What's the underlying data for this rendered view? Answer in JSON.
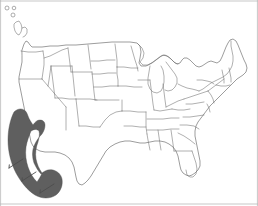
{
  "figure": {
    "width": 258,
    "height": 206,
    "background_color": "#ffffff",
    "frame_color": "#b9b9b9"
  },
  "map": {
    "projection_note": "contiguous United States with state boundaries",
    "outline_color": "#5a5a5a",
    "state_border_color": "#6e6e6e",
    "land_fill_color": "#ffffff"
  },
  "highlight_region": {
    "name": "west-coast-shaded-band",
    "label": "",
    "fill_color": "#5f5f5f",
    "shape": "crescent",
    "location": "Pacific coast / California"
  },
  "annotations": {
    "leader_lines": [
      {
        "name": "leader-line-1",
        "x1": 9,
        "y1": 168,
        "x2": 23,
        "y2": 159
      },
      {
        "name": "leader-line-2",
        "x1": 22,
        "y1": 181,
        "x2": 36,
        "y2": 172
      },
      {
        "name": "leader-line-3",
        "x1": 40,
        "y1": 193,
        "x2": 54,
        "y2": 184
      }
    ],
    "marker_circles": [
      {
        "name": "marker-circle-1",
        "cx": 7,
        "cy": 8,
        "r": 2.0
      },
      {
        "name": "marker-circle-2",
        "cx": 14,
        "cy": 8,
        "r": 1.8
      },
      {
        "name": "marker-circle-3",
        "cx": 13,
        "cy": 15,
        "r": 2.0
      }
    ]
  },
  "labels": {
    "axis_labels": [],
    "legend_entries": [],
    "tick_labels": []
  }
}
